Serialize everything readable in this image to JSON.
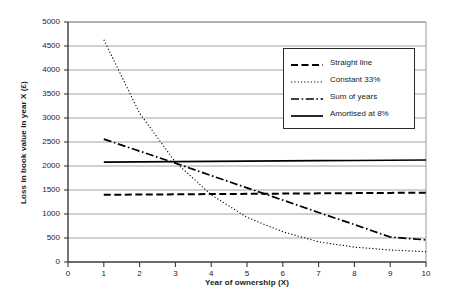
{
  "chart_data": {
    "type": "line",
    "title": "",
    "xlabel": "Year of ownership (X)",
    "ylabel": "Loss in book value in year X (£)",
    "xlim": [
      0,
      10
    ],
    "ylim": [
      0,
      5000
    ],
    "xticks": [
      "0",
      "1",
      "2",
      "3",
      "4",
      "5",
      "6",
      "7",
      "8",
      "9",
      "10"
    ],
    "yticks": [
      "0",
      "500",
      "1000",
      "1500",
      "2000",
      "2500",
      "3000",
      "3500",
      "4000",
      "4500",
      "5000"
    ],
    "grid": true,
    "grid_axis": "y",
    "legend_position": "upper right",
    "x": [
      1,
      2,
      3,
      4,
      5,
      6,
      7,
      8,
      9,
      10
    ],
    "series": [
      {
        "name": "Straight line",
        "style": "dashed",
        "color": "#000000",
        "values": [
          1400,
          1405,
          1410,
          1415,
          1420,
          1425,
          1430,
          1435,
          1440,
          1445
        ]
      },
      {
        "name": "Constant 33%",
        "style": "dotted",
        "color": "#000000",
        "values": [
          4630,
          3100,
          2080,
          1400,
          930,
          630,
          420,
          310,
          250,
          215
        ]
      },
      {
        "name": "Sum of years",
        "style": "dashdot",
        "color": "#000000",
        "values": [
          2560,
          2310,
          2060,
          1800,
          1545,
          1290,
          1030,
          780,
          520,
          460
        ]
      },
      {
        "name": "Amortised at 8%",
        "style": "solid",
        "color": "#000000",
        "values": [
          2080,
          2085,
          2090,
          2095,
          2100,
          2105,
          2110,
          2115,
          2120,
          2125
        ]
      }
    ]
  },
  "axes": {
    "x_title": "Year of ownership (X)",
    "y_title": "Loss in book value in year X (£)"
  },
  "legend": {
    "entries": [
      {
        "label": "Straight line"
      },
      {
        "label": "Constant 33%"
      },
      {
        "label": "Sum of years"
      },
      {
        "label": "Amortised at 8%"
      }
    ]
  },
  "colors": {
    "line": "#000000",
    "grid": "#8c8c8c",
    "axis": "#3a3a3a",
    "background": "#ffffff"
  }
}
